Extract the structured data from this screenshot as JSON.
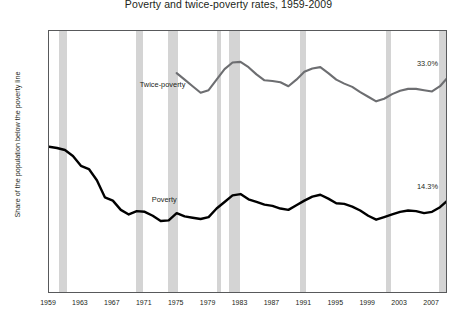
{
  "chart_data": {
    "type": "line",
    "title": "Poverty and twice-poverty rates, 1959-2009",
    "xlabel": "",
    "ylabel": "Share of the population below the poverty line",
    "ylim": [
      0,
      40
    ],
    "xlim": [
      1959,
      2009
    ],
    "grid": false,
    "legend": "inline-annotations",
    "ytick_labels": [
      "0.0%",
      "5.0%",
      "10.0%",
      "15.0%",
      "20.0%",
      "25.0%",
      "30.0%",
      "35.0%",
      "40.0%"
    ],
    "ytick_values": [
      0,
      5,
      10,
      15,
      20,
      25,
      30,
      35,
      40
    ],
    "xtick_labels": [
      "1959",
      "1963",
      "1967",
      "1971",
      "1975",
      "1979",
      "1983",
      "1987",
      "1991",
      "1995",
      "1999",
      "2003",
      "2007"
    ],
    "xtick_values": [
      1959,
      1963,
      1967,
      1971,
      1975,
      1979,
      1983,
      1987,
      1991,
      1995,
      1999,
      2003,
      2007
    ],
    "series": [
      {
        "name": "Poverty",
        "color": "#000000",
        "label_text": "Poverty",
        "label_year": 1972.0,
        "label_value": 14.2,
        "end_label": "14.3%",
        "x": [
          1959,
          1960,
          1961,
          1962,
          1963,
          1964,
          1965,
          1966,
          1967,
          1968,
          1969,
          1970,
          1971,
          1972,
          1973,
          1974,
          1975,
          1976,
          1977,
          1978,
          1979,
          1980,
          1981,
          1982,
          1983,
          1984,
          1985,
          1986,
          1987,
          1988,
          1989,
          1990,
          1991,
          1992,
          1993,
          1994,
          1995,
          1996,
          1997,
          1998,
          1999,
          2000,
          2001,
          2002,
          2003,
          2004,
          2005,
          2006,
          2007,
          2008,
          2009
        ],
        "values": [
          22.4,
          22.2,
          21.9,
          21.0,
          19.5,
          19.0,
          17.3,
          14.7,
          14.2,
          12.8,
          12.1,
          12.6,
          12.5,
          11.9,
          11.1,
          11.2,
          12.3,
          11.8,
          11.6,
          11.4,
          11.7,
          13.0,
          14.0,
          15.0,
          15.2,
          14.4,
          14.0,
          13.6,
          13.4,
          13.0,
          12.8,
          13.5,
          14.2,
          14.8,
          15.1,
          14.5,
          13.8,
          13.7,
          13.3,
          12.7,
          11.9,
          11.3,
          11.7,
          12.1,
          12.5,
          12.7,
          12.6,
          12.3,
          12.5,
          13.2,
          14.3
        ]
      },
      {
        "name": "Twice-poverty",
        "color": "#6d6e71",
        "label_text": "Twice-poverty",
        "label_year": 1970.5,
        "label_value": 31.6,
        "end_label": "33.0%",
        "x": [
          1975,
          1976,
          1977,
          1978,
          1979,
          1980,
          1981,
          1982,
          1983,
          1984,
          1985,
          1986,
          1987,
          1988,
          1989,
          1990,
          1991,
          1992,
          1993,
          1994,
          1995,
          1996,
          1997,
          1998,
          1999,
          2000,
          2001,
          2002,
          2003,
          2004,
          2005,
          2006,
          2007,
          2008,
          2009
        ],
        "values": [
          33.6,
          32.6,
          31.6,
          30.6,
          31.0,
          32.6,
          34.2,
          35.2,
          35.3,
          34.5,
          33.4,
          32.5,
          32.4,
          32.2,
          31.6,
          32.6,
          33.8,
          34.3,
          34.5,
          33.6,
          32.6,
          32.0,
          31.5,
          30.7,
          30.0,
          29.3,
          29.7,
          30.4,
          30.9,
          31.2,
          31.2,
          31.0,
          30.8,
          31.6,
          33.0
        ]
      }
    ],
    "recession_bands": [
      {
        "start": 1960.3,
        "end": 1961.2
      },
      {
        "start": 1969.9,
        "end": 1970.8
      },
      {
        "start": 1973.9,
        "end": 1975.2
      },
      {
        "start": 1980.0,
        "end": 1980.5
      },
      {
        "start": 1981.5,
        "end": 1982.9
      },
      {
        "start": 1990.5,
        "end": 1991.2
      },
      {
        "start": 2001.2,
        "end": 2001.9
      },
      {
        "start": 2007.9,
        "end": 2009.5
      }
    ],
    "band_color": "#d4d4d4"
  }
}
